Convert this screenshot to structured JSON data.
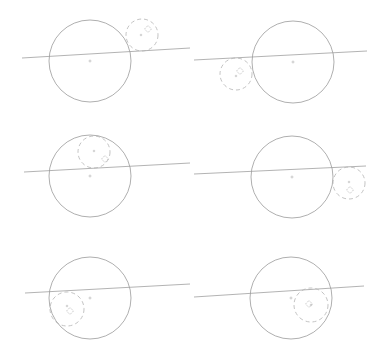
{
  "colors": {
    "background": "#ffffff",
    "big_circle": "#9a9a9a",
    "line": "#a0a0a0",
    "small_circle": "#b4b4b4",
    "marker": "#b0b0b0"
  },
  "panels": [
    {
      "id": 1,
      "big": {
        "cx": 90,
        "cy": 61,
        "r": 41
      },
      "line": {
        "x1": 22,
        "y1": 58,
        "x2": 190,
        "y2": 48
      },
      "small": {
        "cx": 142,
        "cy": 35,
        "r": 16
      },
      "diamond": {
        "x": 148,
        "y": 29
      },
      "small_plus": {
        "x": 141,
        "y": 35
      }
    },
    {
      "id": 2,
      "big": {
        "cx": 293,
        "cy": 62,
        "r": 41
      },
      "line": {
        "x1": 194,
        "y1": 60,
        "x2": 367,
        "y2": 51
      },
      "small": {
        "cx": 236,
        "cy": 74,
        "r": 16
      },
      "diamond": {
        "x": 240,
        "y": 71
      },
      "small_plus": {
        "x": 236,
        "y": 76
      }
    },
    {
      "id": 3,
      "big": {
        "cx": 90,
        "cy": 176,
        "r": 41
      },
      "line": {
        "x1": 24,
        "y1": 172,
        "x2": 190,
        "y2": 163
      },
      "small": {
        "cx": 94,
        "cy": 152,
        "r": 16
      },
      "diamond": {
        "x": 105,
        "y": 159
      },
      "small_plus": {
        "x": 94,
        "y": 151
      }
    },
    {
      "id": 4,
      "big": {
        "cx": 292,
        "cy": 177,
        "r": 41
      },
      "line": {
        "x1": 194,
        "y1": 174,
        "x2": 366,
        "y2": 166
      },
      "small": {
        "cx": 349,
        "cy": 183,
        "r": 16
      },
      "diamond": {
        "x": 350,
        "y": 190
      },
      "small_plus": {
        "x": 349,
        "y": 182
      }
    },
    {
      "id": 5,
      "big": {
        "cx": 90,
        "cy": 298,
        "r": 41
      },
      "line": {
        "x1": 25,
        "y1": 293,
        "x2": 190,
        "y2": 284
      },
      "small": {
        "cx": 67,
        "cy": 309,
        "r": 17
      },
      "diamond": {
        "x": 70,
        "y": 311
      },
      "small_plus": {
        "x": 67,
        "y": 306
      }
    },
    {
      "id": 6,
      "big": {
        "cx": 291,
        "cy": 298,
        "r": 41
      },
      "line": {
        "x1": 194,
        "y1": 297,
        "x2": 364,
        "y2": 286
      },
      "small": {
        "cx": 311,
        "cy": 305,
        "r": 17
      },
      "diamond": {
        "x": 309,
        "y": 304
      },
      "small_plus": {
        "x": 311,
        "y": 305
      }
    }
  ]
}
